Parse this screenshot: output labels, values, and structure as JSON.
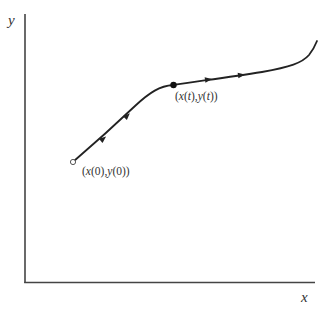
{
  "diagram": {
    "type": "parametric-curve",
    "axes": {
      "x_label": "x",
      "y_label": "y"
    },
    "curve": {
      "color": "#222222",
      "direction_arrows": 4
    },
    "points": {
      "start": {
        "marker": "open-circle",
        "label_x": "x",
        "label_y": "y",
        "param": "0",
        "label": "(x(0),y(0))"
      },
      "current": {
        "marker": "filled-circle",
        "label_x": "x",
        "label_y": "y",
        "param": "t",
        "label": "(x(t),y(t))"
      }
    }
  }
}
